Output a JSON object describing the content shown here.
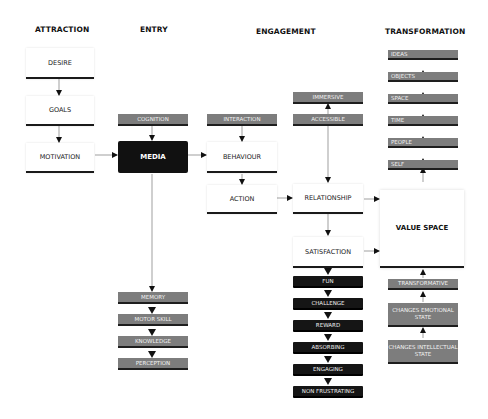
{
  "headers": {
    "attraction": "ATTRACTION",
    "entry": "ENTRY",
    "engagement": "ENGAGEMENT",
    "transformation": "TRANSFORMATION"
  },
  "attraction": {
    "desire": "DESIRE",
    "goals": "GOALS",
    "motivation": "MOTIVATION"
  },
  "entry": {
    "cognition": "COGNITION",
    "media": "MEDIA",
    "outcomes": [
      "MEMORY",
      "MOTOR SKILL",
      "KNOWLEDGE",
      "PERCEPTION"
    ]
  },
  "engagement": {
    "interaction": "INTERACTION",
    "behaviour": "BEHAVIOUR",
    "action": "ACTION",
    "immersive": "IMMERSIVE",
    "accessible": "ACCESSIBLE",
    "relationship": "RELATIONSHIP",
    "satisfaction": "SATISFACTION",
    "qualities": [
      "FUN",
      "CHALLENGE",
      "REWARD",
      "ABSORBING",
      "ENGAGING",
      "NON FRUSTRATING"
    ]
  },
  "transformation": {
    "levels": [
      "IDEAS",
      "OBJECTS",
      "SPACE",
      "TIME",
      "PEOPLE",
      "SELF"
    ],
    "value_space": "VALUE SPACE",
    "transformative": "TRANSFORMATIVE",
    "emotional": "CHANGES EMOTIONAL STATE",
    "intellectual": "CHANGES INTELLECTUAL STATE"
  }
}
